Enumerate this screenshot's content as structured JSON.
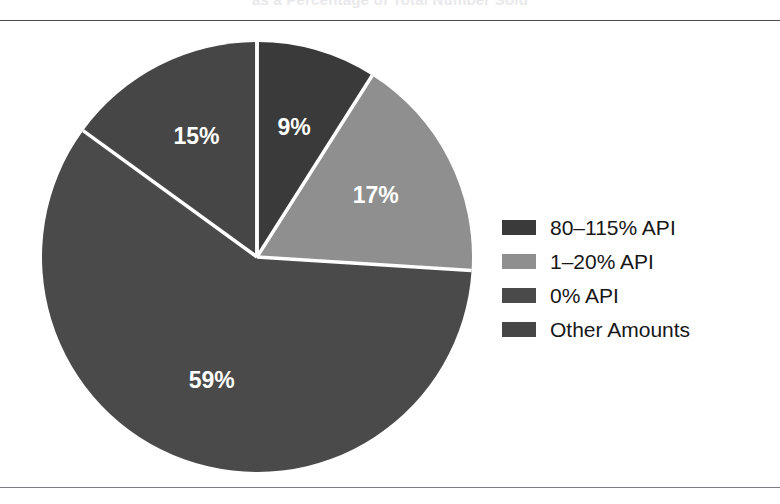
{
  "title": "as a Percentage of Total Number Sold",
  "colors": {
    "background": "#ffffff",
    "rule": "#4a4a4a",
    "rule_bottom": "#7d7d82",
    "label_text": "#ffffff",
    "legend_text": "#171717",
    "divider": "#ffffff",
    "slice_80_115": "#3a3a3a",
    "slice_1_20": "#8f8f8f",
    "slice_0": "#4a4a4a",
    "slice_other": "#464646"
  },
  "chart_data": {
    "type": "pie",
    "title": "as a Percentage of Total Number Sold",
    "legend_position": "right",
    "grid": false,
    "labels": [
      "80–115% API",
      "1–20% API",
      "0% API",
      "Other Amounts"
    ],
    "values": [
      9,
      17,
      59,
      15
    ],
    "value_labels": [
      "9%",
      "17%",
      "59%",
      "15%"
    ],
    "colors": [
      "#3a3a3a",
      "#8f8f8f",
      "#4a4a4a",
      "#464646"
    ],
    "start_angle_deg": 0,
    "direction": "clockwise",
    "units": "percent",
    "slices": [
      {
        "label": "80–115% API",
        "value": 9,
        "value_label": "9%",
        "color": "#3a3a3a"
      },
      {
        "label": "1–20% API",
        "value": 17,
        "value_label": "17%",
        "color": "#8f8f8f"
      },
      {
        "label": "0% API",
        "value": 59,
        "value_label": "59%",
        "color": "#4a4a4a"
      },
      {
        "label": "Other Amounts",
        "value": 15,
        "value_label": "15%",
        "color": "#464646"
      }
    ]
  },
  "geometry": {
    "center_x": 257,
    "center_y": 257,
    "radius": 215
  },
  "legend": {
    "items": [
      {
        "label": "80–115% API",
        "color": "#3a3a3a"
      },
      {
        "label": "1–20% API",
        "color": "#8f8f8f"
      },
      {
        "label": "0% API",
        "color": "#4a4a4a"
      },
      {
        "label": "Other Amounts",
        "color": "#464646"
      }
    ]
  }
}
